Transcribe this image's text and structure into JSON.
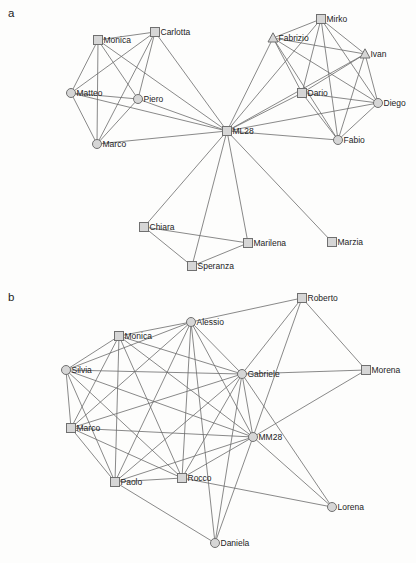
{
  "figure": {
    "width": 416,
    "height": 563,
    "background": "#fdfdfc",
    "edge_color": "#6b6b6b",
    "node_fill": "#d6d6d6",
    "node_stroke": "#707070",
    "label_color": "#1c1c1c",
    "panels": [
      {
        "id": "a",
        "label": "a",
        "label_pos": {
          "x": 8,
          "y": 17
        },
        "nodes": [
          {
            "label": "Monica",
            "shape": "square",
            "x": 98,
            "y": 40
          },
          {
            "label": "Carlotta",
            "shape": "square",
            "x": 155,
            "y": 32
          },
          {
            "label": "Matteo",
            "shape": "circle",
            "x": 71,
            "y": 93
          },
          {
            "label": "Piero",
            "shape": "circle",
            "x": 138,
            "y": 99
          },
          {
            "label": "Marco",
            "shape": "circle",
            "x": 97,
            "y": 144
          },
          {
            "label": "ML28",
            "shape": "square",
            "x": 227,
            "y": 131
          },
          {
            "label": "Mirko",
            "shape": "square",
            "x": 321,
            "y": 19
          },
          {
            "label": "Fabrizio",
            "shape": "triangle",
            "x": 273,
            "y": 38
          },
          {
            "label": "Ivan",
            "shape": "triangle",
            "x": 365,
            "y": 54
          },
          {
            "label": "Dario",
            "shape": "square",
            "x": 302,
            "y": 93
          },
          {
            "label": "Diego",
            "shape": "circle",
            "x": 378,
            "y": 103
          },
          {
            "label": "Fabio",
            "shape": "circle",
            "x": 338,
            "y": 140
          },
          {
            "label": "Chiara",
            "shape": "square",
            "x": 144,
            "y": 227
          },
          {
            "label": "Speranza",
            "shape": "square",
            "x": 192,
            "y": 266
          },
          {
            "label": "Marilena",
            "shape": "square",
            "x": 248,
            "y": 243
          },
          {
            "label": "Marzia",
            "shape": "square",
            "x": 332,
            "y": 242
          }
        ],
        "edges": [
          [
            "Monica",
            "Carlotta"
          ],
          [
            "Monica",
            "Matteo"
          ],
          [
            "Monica",
            "Piero"
          ],
          [
            "Monica",
            "Marco"
          ],
          [
            "Carlotta",
            "Matteo"
          ],
          [
            "Carlotta",
            "Piero"
          ],
          [
            "Carlotta",
            "Marco"
          ],
          [
            "Matteo",
            "Piero"
          ],
          [
            "Matteo",
            "Marco"
          ],
          [
            "Piero",
            "Marco"
          ],
          [
            "ML28",
            "Monica"
          ],
          [
            "ML28",
            "Carlotta"
          ],
          [
            "ML28",
            "Matteo"
          ],
          [
            "ML28",
            "Piero"
          ],
          [
            "ML28",
            "Marco"
          ],
          [
            "Mirko",
            "Fabrizio"
          ],
          [
            "Mirko",
            "Ivan"
          ],
          [
            "Mirko",
            "Dario"
          ],
          [
            "Mirko",
            "Diego"
          ],
          [
            "Mirko",
            "Fabio"
          ],
          [
            "Fabrizio",
            "Ivan"
          ],
          [
            "Fabrizio",
            "Dario"
          ],
          [
            "Fabrizio",
            "Diego"
          ],
          [
            "Fabrizio",
            "Fabio"
          ],
          [
            "Ivan",
            "Dario"
          ],
          [
            "Ivan",
            "Diego"
          ],
          [
            "Ivan",
            "Fabio"
          ],
          [
            "Dario",
            "Diego"
          ],
          [
            "Dario",
            "Fabio"
          ],
          [
            "Diego",
            "Fabio"
          ],
          [
            "ML28",
            "Mirko"
          ],
          [
            "ML28",
            "Fabrizio"
          ],
          [
            "ML28",
            "Ivan"
          ],
          [
            "ML28",
            "Dario"
          ],
          [
            "ML28",
            "Diego"
          ],
          [
            "ML28",
            "Fabio"
          ],
          [
            "ML28",
            "Chiara"
          ],
          [
            "ML28",
            "Speranza"
          ],
          [
            "ML28",
            "Marilena"
          ],
          [
            "ML28",
            "Marzia"
          ],
          [
            "Chiara",
            "Speranza"
          ],
          [
            "Chiara",
            "Marilena"
          ],
          [
            "Speranza",
            "Marilena"
          ]
        ]
      },
      {
        "id": "b",
        "label": "b",
        "label_pos": {
          "x": 8,
          "y": 301
        },
        "nodes": [
          {
            "label": "Monica",
            "shape": "square",
            "x": 119,
            "y": 336
          },
          {
            "label": "Alessio",
            "shape": "circle",
            "x": 191,
            "y": 322
          },
          {
            "label": "Roberto",
            "shape": "square",
            "x": 302,
            "y": 298
          },
          {
            "label": "Silvia",
            "shape": "circle",
            "x": 66,
            "y": 370
          },
          {
            "label": "Gabriele",
            "shape": "circle",
            "x": 242,
            "y": 374
          },
          {
            "label": "Morena",
            "shape": "square",
            "x": 366,
            "y": 370
          },
          {
            "label": "Marco",
            "shape": "square",
            "x": 71,
            "y": 428
          },
          {
            "label": "MM28",
            "shape": "circle",
            "x": 253,
            "y": 437
          },
          {
            "label": "Paolo",
            "shape": "square",
            "x": 115,
            "y": 482
          },
          {
            "label": "Rocco",
            "shape": "square",
            "x": 182,
            "y": 478
          },
          {
            "label": "Lorena",
            "shape": "circle",
            "x": 332,
            "y": 507
          },
          {
            "label": "Daniela",
            "shape": "circle",
            "x": 215,
            "y": 543
          }
        ],
        "edges": [
          [
            "Silvia",
            "Monica"
          ],
          [
            "Silvia",
            "Alessio"
          ],
          [
            "Silvia",
            "Gabriele"
          ],
          [
            "Silvia",
            "Marco"
          ],
          [
            "Silvia",
            "Paolo"
          ],
          [
            "Silvia",
            "Rocco"
          ],
          [
            "Silvia",
            "MM28"
          ],
          [
            "Monica",
            "Alessio"
          ],
          [
            "Monica",
            "Gabriele"
          ],
          [
            "Monica",
            "Marco"
          ],
          [
            "Monica",
            "Paolo"
          ],
          [
            "Monica",
            "Rocco"
          ],
          [
            "Monica",
            "MM28"
          ],
          [
            "Alessio",
            "Gabriele"
          ],
          [
            "Alessio",
            "Marco"
          ],
          [
            "Alessio",
            "Paolo"
          ],
          [
            "Alessio",
            "Rocco"
          ],
          [
            "Alessio",
            "MM28"
          ],
          [
            "Gabriele",
            "Marco"
          ],
          [
            "Gabriele",
            "Paolo"
          ],
          [
            "Gabriele",
            "Rocco"
          ],
          [
            "Gabriele",
            "MM28"
          ],
          [
            "Marco",
            "Paolo"
          ],
          [
            "Marco",
            "Rocco"
          ],
          [
            "Marco",
            "MM28"
          ],
          [
            "Paolo",
            "Rocco"
          ],
          [
            "Paolo",
            "MM28"
          ],
          [
            "Rocco",
            "MM28"
          ],
          [
            "Roberto",
            "Alessio"
          ],
          [
            "Roberto",
            "Gabriele"
          ],
          [
            "Roberto",
            "Morena"
          ],
          [
            "Roberto",
            "MM28"
          ],
          [
            "Morena",
            "Gabriele"
          ],
          [
            "Morena",
            "MM28"
          ],
          [
            "Lorena",
            "Gabriele"
          ],
          [
            "Lorena",
            "MM28"
          ],
          [
            "Lorena",
            "Rocco"
          ],
          [
            "Daniela",
            "Paolo"
          ],
          [
            "Daniela",
            "Alessio"
          ],
          [
            "Daniela",
            "Gabriele"
          ],
          [
            "Daniela",
            "MM28"
          ]
        ]
      }
    ]
  }
}
